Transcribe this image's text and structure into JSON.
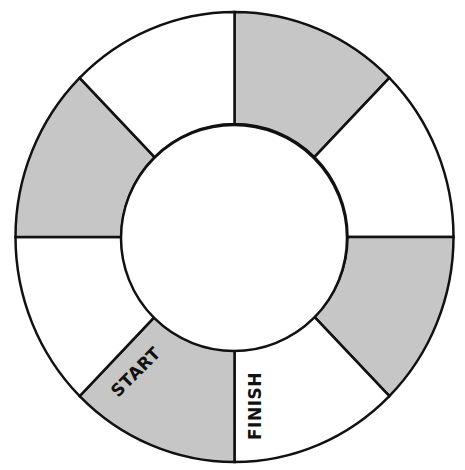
{
  "board": {
    "type": "circular-path-game-board",
    "segment_count": 8,
    "colors": {
      "shaded": "#c6c6c6",
      "plain": "#ffffff",
      "stroke": "#111111"
    },
    "segments": [
      {
        "position": "top-right",
        "shaded": true,
        "label": ""
      },
      {
        "position": "right-upper",
        "shaded": false,
        "label": ""
      },
      {
        "position": "right-lower",
        "shaded": true,
        "label": ""
      },
      {
        "position": "bottom-right",
        "shaded": false,
        "label": "FINISH"
      },
      {
        "position": "bottom-left",
        "shaded": true,
        "label": "START"
      },
      {
        "position": "left-lower",
        "shaded": false,
        "label": ""
      },
      {
        "position": "left-upper",
        "shaded": true,
        "label": ""
      },
      {
        "position": "top-left",
        "shaded": false,
        "label": ""
      }
    ],
    "start_label": "START",
    "finish_label": "FINISH"
  }
}
